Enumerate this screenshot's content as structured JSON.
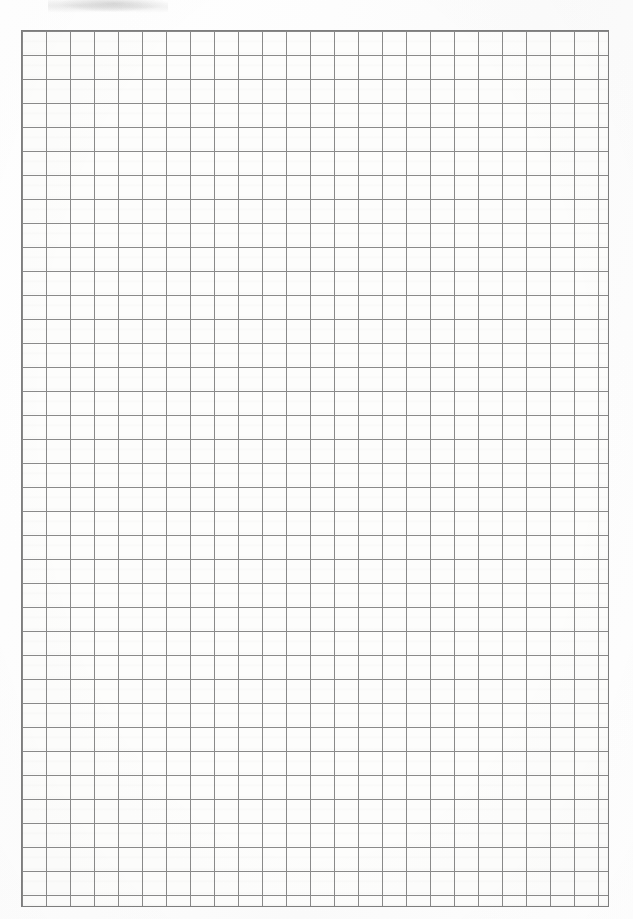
{
  "document": {
    "kind": "grid-paper-scan",
    "page_width": 633,
    "page_height": 919,
    "background_color": "#ffffff",
    "paper_color": "#fdfdfc"
  },
  "grid": {
    "label": "square-grid",
    "left": 21,
    "top": 30,
    "width": 588,
    "height": 877,
    "cell_width": 24,
    "cell_height": 24,
    "columns": 24,
    "rows": 36,
    "line_color": "#8a8a8a",
    "line_width": 1,
    "border_color": "#7e7e7e",
    "border_width": 1,
    "major_lines": false
  },
  "artifacts": {
    "smudge_label": "scan-smudge",
    "smudge_left": 48,
    "smudge_top": 0,
    "smudge_width": 120,
    "smudge_height": 14
  }
}
